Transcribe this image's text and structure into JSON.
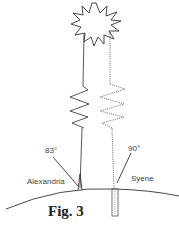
{
  "figure": {
    "caption": "Fig. 3",
    "labels": {
      "angle_alexandria": "83°",
      "angle_syene": "90°",
      "city_alexandria": "Alexandria",
      "city_syene": "Syene"
    },
    "elements": {
      "sun": "sun-icon",
      "ray_alexandria": "solid line",
      "ray_syene": "dotted line",
      "earth_surface": "curved line",
      "well": "vertical well at Syene",
      "gnomon": "stick at Alexandria"
    },
    "colors": {
      "stroke": "#333333",
      "text": "#444444",
      "background": "#ffffff"
    }
  }
}
